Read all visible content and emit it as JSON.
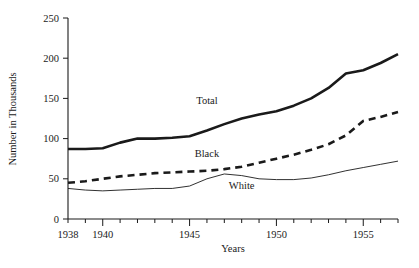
{
  "chart_data": {
    "type": "line",
    "title": "",
    "xlabel": "Years",
    "ylabel": "Number in Thousands",
    "xlim": [
      1938,
      1957
    ],
    "ylim": [
      0,
      250
    ],
    "yticks": [
      0,
      50,
      100,
      150,
      200,
      250
    ],
    "ytick_labels": [
      "0",
      "50",
      "100",
      "150",
      "200",
      "250"
    ],
    "xticks": [
      1938,
      1939,
      1940,
      1941,
      1942,
      1943,
      1944,
      1945,
      1946,
      1947,
      1948,
      1949,
      1950,
      1951,
      1952,
      1953,
      1954,
      1955,
      1956,
      1957
    ],
    "xtick_labels_shown": [
      "1938",
      "1940",
      "1945",
      "1950",
      "1955"
    ],
    "xtick_labels_shown_at": [
      1938,
      1940,
      1945,
      1950,
      1955
    ],
    "grid": false,
    "legend_position": "inline-annotations",
    "x": [
      1938,
      1939,
      1940,
      1941,
      1942,
      1943,
      1944,
      1945,
      1946,
      1947,
      1948,
      1949,
      1950,
      1951,
      1952,
      1953,
      1954,
      1955,
      1956,
      1957
    ],
    "series": [
      {
        "name": "Total",
        "style": "thick-solid",
        "color": "#1a1a1a",
        "label_x": 1946,
        "label_y": 143,
        "values": [
          87,
          87,
          88,
          95,
          100,
          100,
          101,
          103,
          110,
          118,
          125,
          130,
          134,
          141,
          150,
          163,
          181,
          185,
          194,
          205
        ]
      },
      {
        "name": "Black",
        "style": "thick-dashed",
        "color": "#1a1a1a",
        "label_x": 1946,
        "label_y": 77,
        "values": [
          45,
          47,
          50,
          53,
          55,
          57,
          58,
          59,
          60,
          62,
          65,
          70,
          75,
          80,
          86,
          93,
          104,
          122,
          127,
          133
        ]
      },
      {
        "name": "White",
        "style": "thin-solid",
        "color": "#1a1a1a",
        "label_x": 1948,
        "label_y": 37,
        "values": [
          38,
          36,
          35,
          36,
          37,
          38,
          38,
          41,
          50,
          56,
          54,
          50,
          49,
          49,
          51,
          55,
          60,
          64,
          68,
          72
        ]
      }
    ]
  }
}
